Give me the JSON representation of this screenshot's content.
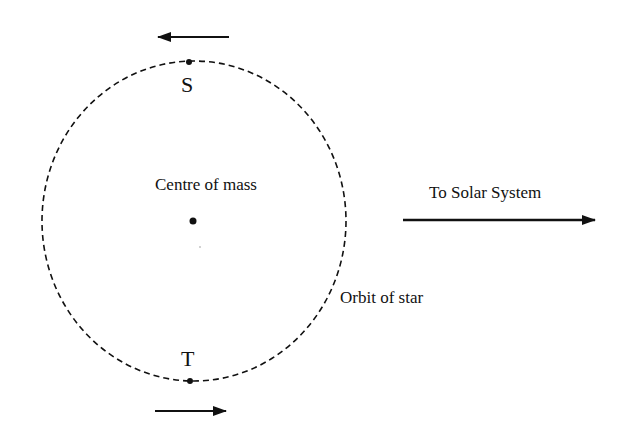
{
  "diagram": {
    "labels": {
      "top_point": "S",
      "bottom_point": "T",
      "centre": "Centre of mass",
      "direction": "To Solar System",
      "orbit": "Orbit of star"
    },
    "orbit": {
      "cx": 194,
      "cy": 221,
      "rx": 152,
      "ry": 160,
      "style": "dashed"
    },
    "points": {
      "S": {
        "x": 189,
        "y": 62
      },
      "T": {
        "x": 190,
        "y": 381
      },
      "centre_of_mass": {
        "x": 193,
        "y": 221
      }
    },
    "arrows": {
      "top_velocity": {
        "from": [
          229,
          37
        ],
        "to": [
          157,
          37
        ],
        "direction": "left"
      },
      "bottom_velocity": {
        "from": [
          155,
          411
        ],
        "to": [
          227,
          411
        ],
        "direction": "right"
      },
      "to_solar_system": {
        "from": [
          403,
          220
        ],
        "to": [
          596,
          220
        ],
        "direction": "right"
      }
    },
    "colors": {
      "stroke": "#111111",
      "background": "#ffffff"
    }
  }
}
